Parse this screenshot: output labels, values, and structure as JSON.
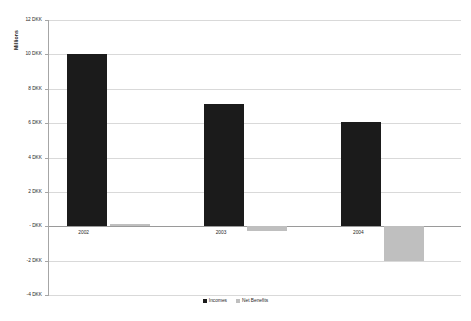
{
  "chart_data": {
    "type": "bar",
    "title": "",
    "subtitle": "",
    "xlabel": "",
    "ylabel": "Millions",
    "categories": [
      "2002",
      "2003",
      "2004"
    ],
    "series": [
      {
        "name": "Incomes",
        "color": "#1b1b1b",
        "values": [
          10.0,
          7.1,
          6.05
        ]
      },
      {
        "name": "Net Benefits",
        "color": "#bfbfbf",
        "values": [
          0.15,
          -0.25,
          -2.0
        ]
      }
    ],
    "ylim": [
      -4,
      12
    ],
    "ytick_values": [
      12,
      10,
      8,
      6,
      4,
      2,
      0,
      -2,
      -4
    ],
    "ytick_labels": [
      "12 DKK",
      "10 DKK",
      "8 DKK",
      "6 DKK",
      "4 DKK",
      "2 DKK",
      "- DKK",
      "-2 DKK",
      "-4 DKK"
    ],
    "grid": true,
    "legend_position": "bottom",
    "legend_entries": [
      "Incomes",
      "Net Benefits"
    ],
    "annotations": []
  },
  "axis": {
    "y_title": "Millions"
  },
  "legend": {
    "items": [
      {
        "label": "Incomes"
      },
      {
        "label": "Net Benefits"
      }
    ]
  }
}
